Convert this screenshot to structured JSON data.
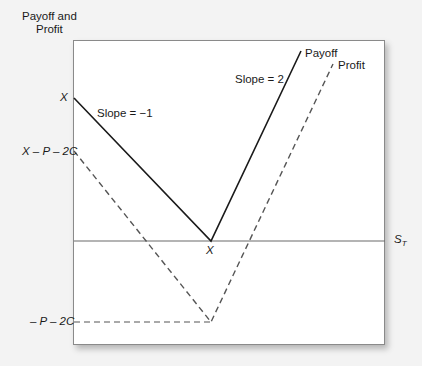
{
  "diagram": {
    "y_axis_label_line1": "Payoff and",
    "y_axis_label_line2": "Profit",
    "x_axis_label": "S",
    "x_axis_label_sub": "T",
    "y_ticks": {
      "x": "X",
      "x_minus_p_minus_2c": "X – P – 2C",
      "neg_p_minus_2c": "– P – 2C"
    },
    "x_tick_strike": "X",
    "annotations": {
      "slope_left": "Slope = −1",
      "slope_right": "Slope = 2"
    },
    "series": [
      {
        "name": "Payoff",
        "style": "solid",
        "color": "#1a1a1a"
      },
      {
        "name": "Profit",
        "style": "dashed",
        "color": "#555555"
      }
    ]
  }
}
